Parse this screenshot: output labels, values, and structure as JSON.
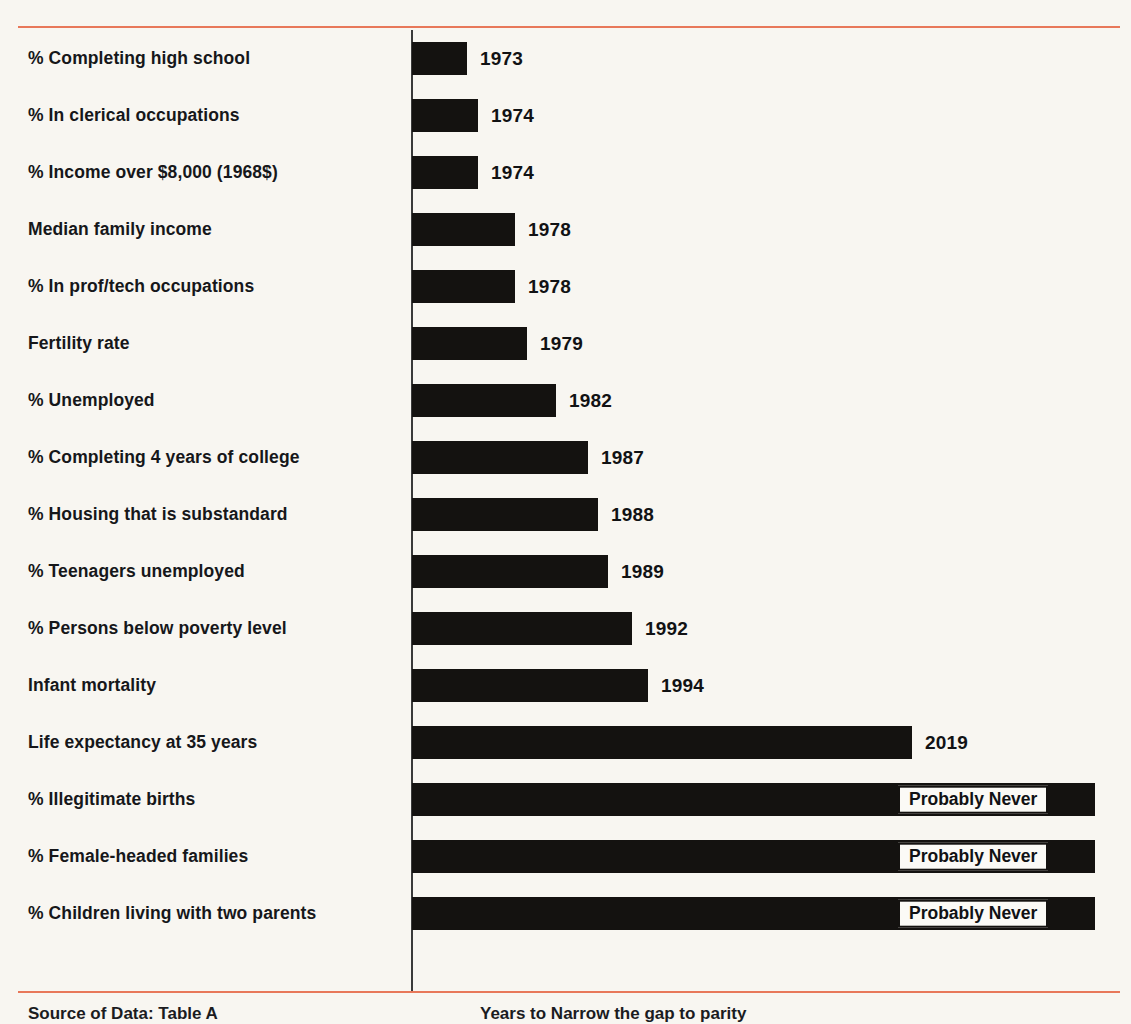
{
  "chart_data": {
    "type": "bar",
    "title": "",
    "subtitle": "",
    "xlabel": "",
    "ylabel": "",
    "orientation": "horizontal",
    "grid": false,
    "legend": null,
    "axis_note": "Vertical baseline axis at left of bars; no numeric tick labels shown",
    "value_kind": "Projected year of parity (bar length encodes years to close the gap)",
    "categories": [
      "% Completing high school",
      "% In clerical occupations",
      "% Income over $8,000 (1968$)",
      "Median family income",
      "% In prof/tech occupations",
      "Fertility rate",
      "% Unemployed",
      "% Completing 4 years of college",
      "% Housing that is substandard",
      "% Teenagers unemployed",
      "% Persons below poverty level",
      "Infant mortality",
      "Life expectancy at 35 years",
      "% Illegitimate births",
      "% Female-headed families",
      "% Children living with two parents"
    ],
    "values": [
      "1973",
      "1974",
      "1974",
      "1978",
      "1978",
      "1979",
      "1982",
      "1987",
      "1988",
      "1989",
      "1992",
      "1994",
      "2019",
      "Probably Never",
      "Probably Never",
      "Probably Never"
    ],
    "bars": [
      {
        "label": "% Completing high school",
        "value": "1973",
        "length_px": 55,
        "value_inside": false
      },
      {
        "label": "% In clerical occupations",
        "value": "1974",
        "length_px": 66,
        "value_inside": false
      },
      {
        "label": "% Income over $8,000 (1968$)",
        "value": "1974",
        "length_px": 66,
        "value_inside": false
      },
      {
        "label": "Median family income",
        "value": "1978",
        "length_px": 103,
        "value_inside": false
      },
      {
        "label": "% In prof/tech occupations",
        "value": "1978",
        "length_px": 103,
        "value_inside": false
      },
      {
        "label": "Fertility rate",
        "value": "1979",
        "length_px": 115,
        "value_inside": false
      },
      {
        "label": "% Unemployed",
        "value": "1982",
        "length_px": 144,
        "value_inside": false
      },
      {
        "label": "% Completing 4 years of college",
        "value": "1987",
        "length_px": 176,
        "value_inside": false
      },
      {
        "label": "% Housing that is substandard",
        "value": "1988",
        "length_px": 186,
        "value_inside": false
      },
      {
        "label": "% Teenagers unemployed",
        "value": "1989",
        "length_px": 196,
        "value_inside": false
      },
      {
        "label": "% Persons below poverty level",
        "value": "1992",
        "length_px": 220,
        "value_inside": false
      },
      {
        "label": "Infant mortality",
        "value": "1994",
        "length_px": 236,
        "value_inside": false
      },
      {
        "label": "Life expectancy at 35 years",
        "value": "2019",
        "length_px": 500,
        "value_inside": false
      },
      {
        "label": "% Illegitimate births",
        "value": "Probably Never",
        "length_px": 683,
        "value_inside": true
      },
      {
        "label": "% Female-headed families",
        "value": "Probably Never",
        "length_px": 683,
        "value_inside": true
      },
      {
        "label": "% Children living with two parents",
        "value": "Probably Never",
        "length_px": 683,
        "value_inside": true
      }
    ]
  },
  "footer": {
    "source": "Source of Data: Table A",
    "note": "Years to Narrow the gap to parity"
  },
  "colors": {
    "rule": "#e8785a",
    "bar": "#141210",
    "axis": "#3a3a3a",
    "background": "#f8f6f1",
    "text": "#16171a"
  }
}
